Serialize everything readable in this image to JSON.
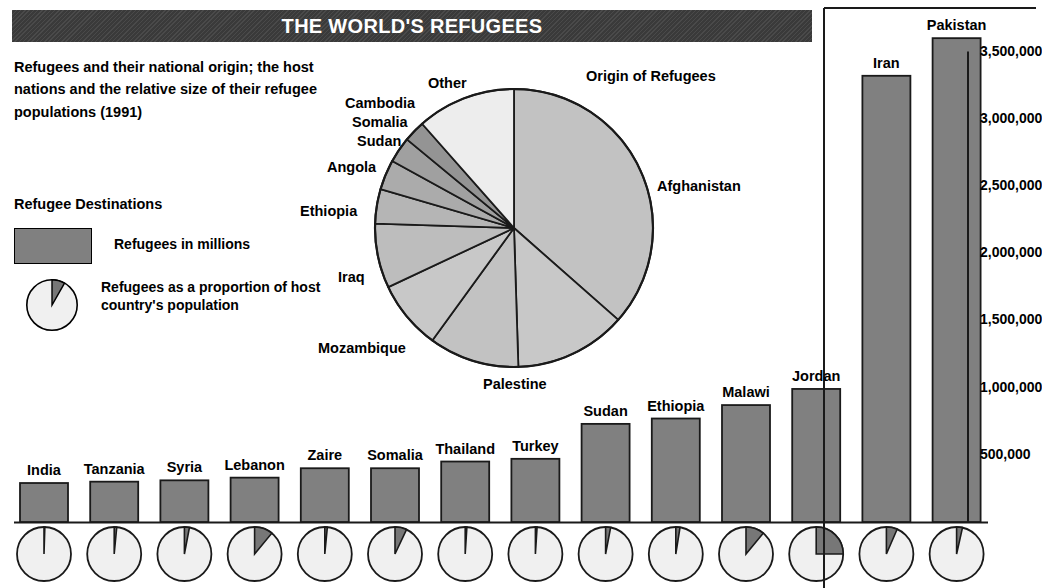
{
  "title": "THE WORLD'S REFUGEES",
  "deck": "Refugees and their national origin; the host nations and the relative size of their refugee populations (1991)",
  "legend": {
    "heading": "Refugee Destinations",
    "bar_item": "Refugees in millions",
    "pie_item": "Refugees as a proportion of host country's population"
  },
  "pie_title": "Origin of Refugees",
  "chart_data": [
    {
      "type": "pie",
      "title": "Origin of Refugees",
      "legend_position": "callout-labels",
      "labels": [
        "Afghanistan",
        "Palestine",
        "Mozambique",
        "Iraq",
        "Ethiopia",
        "Angola",
        "Sudan",
        "Somalia",
        "Cambodia",
        "Other"
      ],
      "values": [
        36.5,
        13.0,
        10.5,
        8.0,
        7.5,
        4.0,
        3.5,
        3.0,
        2.5,
        11.5
      ],
      "unit": "percent of world refugees",
      "start_angle_deg": 0,
      "colors": [
        "#c2c2c2",
        "#c8c8c8",
        "#c2c2c2",
        "#c8c8c8",
        "#bdbdbd",
        "#b5b5b5",
        "#ababab",
        "#a0a0a0",
        "#949494",
        "#ededed"
      ]
    },
    {
      "type": "bar",
      "title": "Refugee Destinations",
      "xlabel": "",
      "ylabel": "Refugees",
      "ylim": [
        0,
        3750000
      ],
      "grid": false,
      "categories": [
        "India",
        "Tanzania",
        "Syria",
        "Lebanon",
        "Zaire",
        "Somalia",
        "Thailand",
        "Turkey",
        "Sudan",
        "Ethiopia",
        "Malawi",
        "Jordan",
        "Iran",
        "Pakistan"
      ],
      "values": [
        290000,
        300000,
        310000,
        330000,
        400000,
        400000,
        450000,
        470000,
        730000,
        770000,
        870000,
        990000,
        3320000,
        3600000
      ],
      "tick_labels": [
        "500,000",
        "1,000,000",
        "1,500,000",
        "2,000,000",
        "2,500,000",
        "3,000,000",
        "3,500,000"
      ],
      "tick_values": [
        500000,
        1000000,
        1500000,
        2000000,
        2500000,
        3000000,
        3500000
      ],
      "bar_color": "#808080"
    },
    {
      "type": "pie",
      "title": "Refugees as a proportion of host country's population",
      "labels": [
        "India",
        "Tanzania",
        "Syria",
        "Lebanon",
        "Zaire",
        "Somalia",
        "Thailand",
        "Turkey",
        "Sudan",
        "Ethiopia",
        "Malawi",
        "Jordan",
        "Iran",
        "Pakistan"
      ],
      "values": [
        0.5,
        1.5,
        3.0,
        11.0,
        1.5,
        7.0,
        1.0,
        1.0,
        3.0,
        2.5,
        11.0,
        25.0,
        6.5,
        3.5
      ],
      "unit": "percent of host population",
      "colors": [
        "#777777",
        "#f0f0f0"
      ]
    }
  ],
  "axis_ticks": [
    {
      "label": "3,500,000"
    },
    {
      "label": "3,000,000"
    },
    {
      "label": "2,500,000"
    },
    {
      "label": "2,000,000"
    },
    {
      "label": "1,500,000"
    },
    {
      "label": "1,000,000"
    },
    {
      "label": "500,000"
    }
  ]
}
